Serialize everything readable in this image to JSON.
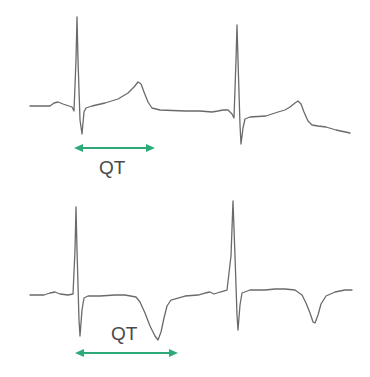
{
  "diagram": {
    "colors": {
      "trace": "#6a6a6a",
      "arrow": "#2eaa78",
      "label": "#4a4a4a",
      "background": "#ffffff"
    },
    "panels": [
      {
        "id": "normal",
        "description": "ECG with upright T wave",
        "interval_label": "QT"
      },
      {
        "id": "inverted",
        "description": "ECG with inverted T wave (longer QT)",
        "interval_label": "QT"
      }
    ]
  }
}
